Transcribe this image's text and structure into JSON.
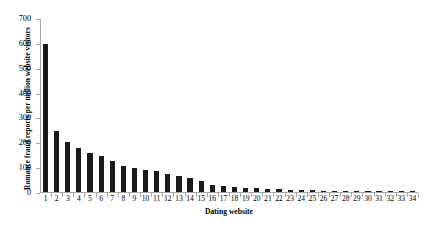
{
  "chart_data": {
    "type": "bar",
    "title": "",
    "subtitle": "",
    "xlabel": "Dating website",
    "ylabel": "Romance fraud reports per million website visitors",
    "categories": [
      "1",
      "2",
      "3",
      "4",
      "5",
      "6",
      "7",
      "8",
      "9",
      "10",
      "11",
      "12",
      "13",
      "14",
      "15",
      "16",
      "17",
      "18",
      "19",
      "20",
      "21",
      "22",
      "23",
      "24",
      "25",
      "26",
      "27",
      "28",
      "29",
      "30",
      "31",
      "32",
      "33",
      "34"
    ],
    "values": [
      597,
      248,
      201,
      177,
      156,
      144,
      127,
      104,
      98,
      90,
      84,
      71,
      64,
      58,
      45,
      29,
      24,
      21,
      18,
      16,
      14,
      11,
      9,
      8,
      7,
      6,
      5,
      4,
      3,
      3,
      2,
      2,
      1,
      1
    ],
    "ylim": [
      0,
      700
    ],
    "ytick_labels": [
      "0",
      "100",
      "200",
      "300",
      "400",
      "500",
      "600",
      "700"
    ],
    "ytick_values": [
      0,
      100,
      200,
      300,
      400,
      500,
      600,
      700
    ],
    "grid": false,
    "legend": false,
    "legend_position": "none",
    "bar_color": "#1a1a1a",
    "axis_color": "#a6a6a6",
    "background_color": "#ffffff",
    "series": [
      {
        "name": "Romance fraud reports per million website visitors",
        "values": [
          597,
          248,
          201,
          177,
          156,
          144,
          127,
          104,
          98,
          90,
          84,
          71,
          64,
          58,
          45,
          29,
          24,
          21,
          18,
          16,
          14,
          11,
          9,
          8,
          7,
          6,
          5,
          4,
          3,
          3,
          2,
          2,
          1,
          1
        ]
      }
    ]
  }
}
